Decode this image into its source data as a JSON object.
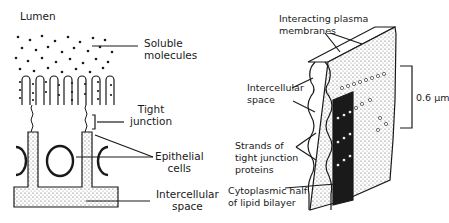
{
  "left_diagram": {
    "title": "Lumen",
    "labels": {
      "soluble_line1": "Soluble",
      "soluble_line2": "molecules",
      "tight_line1": "Tight",
      "tight_line2": "junction",
      "epithelial_line1": "Epithelial",
      "epithelial_line2": "cells",
      "intercellular_line1": "Intercellular",
      "intercellular_line2": "space"
    }
  },
  "right_diagram": {
    "labels": {
      "membranes_line1": "Interacting plasma",
      "membranes_line2": "membranes",
      "space_line1": "Intercellular",
      "space_line2": "space",
      "strands_line1": "Strands of",
      "strands_line2": "tight junction",
      "strands_line3": "proteins",
      "cyto_line1": "Cytoplasmic half",
      "cyto_line2": "of lipid bilayer",
      "scale": "0.6 µm"
    }
  },
  "colors": {
    "ink": "#1a1a1a",
    "background": "#ffffff",
    "stipple": "#d9d9d9"
  }
}
